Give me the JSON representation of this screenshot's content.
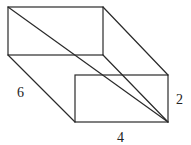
{
  "figure": {
    "type": "rectangular-prism",
    "labels": {
      "depth": "6",
      "height": "2",
      "width": "4"
    },
    "stroke_color": "#2a2a2a",
    "background": "#ffffff"
  }
}
